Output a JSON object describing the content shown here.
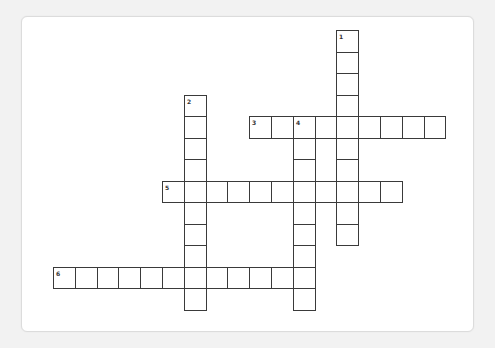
{
  "puzzle": {
    "grid": {
      "origin_x": 53,
      "origin_y": 30,
      "cell_w": 21.8,
      "cell_h": 21.5,
      "line_color": "#3a3a3a"
    },
    "entries": [
      {
        "number": "1",
        "direction": "down",
        "row": 0,
        "col": 13,
        "length": 10
      },
      {
        "number": "2",
        "direction": "down",
        "row": 3,
        "col": 6,
        "length": 10
      },
      {
        "number": "3",
        "direction": "across",
        "row": 4,
        "col": 9,
        "length": 9
      },
      {
        "number": "4",
        "direction": "down",
        "row": 4,
        "col": 11,
        "length": 9
      },
      {
        "number": "5",
        "direction": "across",
        "row": 7,
        "col": 5,
        "length": 11
      },
      {
        "number": "6",
        "direction": "across",
        "row": 11,
        "col": 0,
        "length": 12
      }
    ]
  }
}
